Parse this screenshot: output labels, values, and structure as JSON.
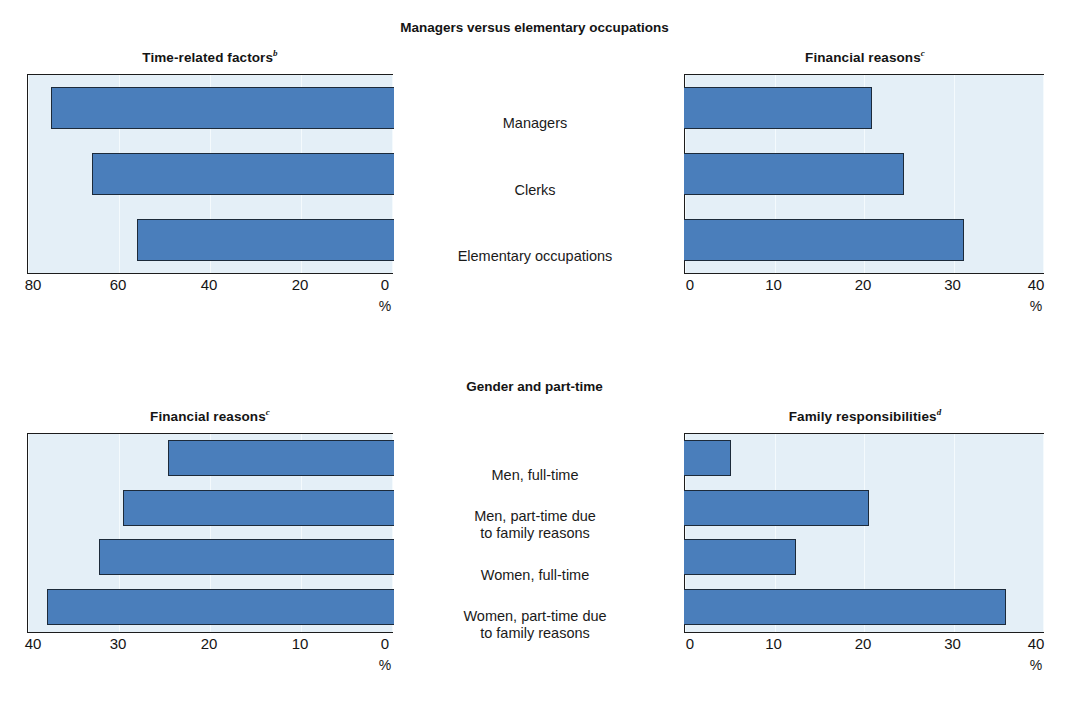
{
  "figure": {
    "section_titles": {
      "top": "Managers versus elementary occupations",
      "bottom": "Gender and part-time"
    },
    "axis_unit": "%"
  },
  "chart_data": [
    {
      "id": "top-left",
      "type": "bar",
      "orientation": "horizontal",
      "title": "Time-related factors",
      "title_superscript": "b",
      "categories": [
        "Managers",
        "Clerks",
        "Elementary occupations"
      ],
      "values": [
        75,
        66,
        56
      ],
      "xlabel": "%",
      "ylabel": "",
      "xlim": [
        80,
        0
      ],
      "reversed": true,
      "ticks": [
        "80",
        "60",
        "40",
        "20",
        "0"
      ],
      "tick_values": [
        80,
        60,
        40,
        20,
        0
      ],
      "grid": true
    },
    {
      "id": "top-right",
      "type": "bar",
      "orientation": "horizontal",
      "title": "Financial reasons",
      "title_superscript": "c",
      "categories": [
        "Managers",
        "Clerks",
        "Elementary occupations"
      ],
      "values": [
        21,
        24.6,
        31.3
      ],
      "xlabel": "%",
      "ylabel": "",
      "xlim": [
        0,
        40
      ],
      "reversed": false,
      "ticks": [
        "0",
        "10",
        "20",
        "30",
        "40"
      ],
      "tick_values": [
        0,
        10,
        20,
        30,
        40
      ],
      "grid": true
    },
    {
      "id": "bottom-left",
      "type": "bar",
      "orientation": "horizontal",
      "title": "Financial reasons",
      "title_superscript": "c",
      "categories": [
        "Men, full-time",
        "Men, part-time due to family reasons",
        "Women, full-time",
        "Women, part-time due to family reasons"
      ],
      "values": [
        24.6,
        29.6,
        32.2,
        37.9
      ],
      "xlabel": "%",
      "ylabel": "",
      "xlim": [
        40,
        0
      ],
      "reversed": true,
      "ticks": [
        "40",
        "30",
        "20",
        "10",
        "0"
      ],
      "tick_values": [
        40,
        30,
        20,
        10,
        0
      ],
      "grid": true
    },
    {
      "id": "bottom-right",
      "type": "bar",
      "orientation": "horizontal",
      "title": "Family responsibilities",
      "title_superscript": "d",
      "categories": [
        "Men, full-time",
        "Men, part-time due to family reasons",
        "Women, full-time",
        "Women, part-time due to family reasons"
      ],
      "values": [
        5.3,
        20.7,
        12.5,
        36.0
      ],
      "xlabel": "%",
      "ylabel": "",
      "xlim": [
        0,
        40
      ],
      "reversed": false,
      "ticks": [
        "0",
        "10",
        "20",
        "30",
        "40"
      ],
      "tick_values": [
        0,
        10,
        20,
        30,
        40
      ],
      "grid": true
    }
  ],
  "center_labels": {
    "top": [
      "Managers",
      "Clerks",
      "Elementary occupations"
    ],
    "bottom": [
      "Men, full-time",
      "Men, part-time due\nto family reasons",
      "Women, full-time",
      "Women, part-time due\nto family reasons"
    ]
  },
  "colors": {
    "bar_fill": "#4a7ebb",
    "bar_stroke": "#1c2a3a",
    "plot_background": "#e4eff7",
    "frame": "#1c1c1c",
    "text": "#1a1a1a"
  }
}
